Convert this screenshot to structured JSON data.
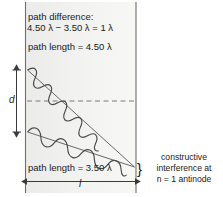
{
  "figure": {
    "type": "wave-interference-diagram",
    "background_color": "#f1f1ef",
    "line_color": "#4d4d4d",
    "text_color": "#1b1b1b",
    "annotations": {
      "path_difference_label": "path difference:",
      "path_difference_equation": "4.50 λ − 3.50 λ = 1 λ",
      "path_length_top": "path length = 4.50 λ",
      "path_length_bottom": "path length = 3.50 λ",
      "separation_label": "d",
      "distance_label": "l",
      "brace_glyph": "}",
      "caption_line_1": "constructive",
      "caption_line_2": "interference at",
      "caption_line_3": "n = 1 antinode"
    },
    "values": {
      "upper_path_length": "4.50 λ",
      "lower_path_length": "3.50 λ",
      "path_difference": "1 λ",
      "antinode_order": "n = 1"
    }
  }
}
